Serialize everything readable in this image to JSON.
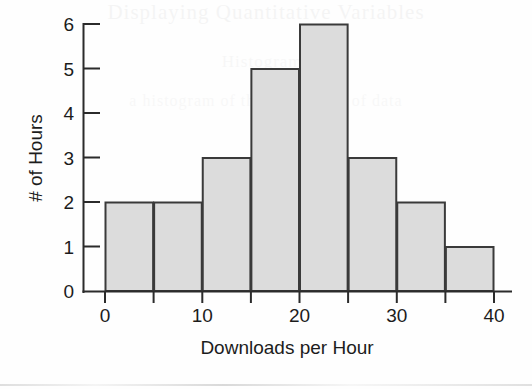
{
  "figure": {
    "background_color": "#fefefe",
    "bar_fill_color": "#dcdcdc",
    "bar_stroke_color": "#3a3a3a",
    "axis_color": "#2b2b2b",
    "ghost_text_top": "Displaying Quantitative Variables",
    "ghost_text_mid": "Histograms",
    "ghost_text_low": "a histogram of the downloads of data"
  },
  "chart_data": {
    "type": "bar",
    "subtype": "histogram",
    "title": "",
    "xlabel": "Downloads per Hour",
    "ylabel": "# of Hours",
    "bin_width": 5,
    "bin_edges": [
      0,
      5,
      10,
      15,
      20,
      25,
      30,
      35,
      40
    ],
    "categories": [
      "0-5",
      "5-10",
      "10-15",
      "15-20",
      "20-25",
      "25-30",
      "30-35",
      "35-40"
    ],
    "values": [
      2,
      2,
      3,
      5,
      6,
      3,
      2,
      1
    ],
    "xlim": [
      0,
      40
    ],
    "ylim": [
      0,
      6
    ],
    "x_ticks": [
      0,
      5,
      10,
      15,
      20,
      25,
      30,
      35,
      40
    ],
    "x_tick_labels": [
      "0",
      "",
      "10",
      "",
      "20",
      "",
      "30",
      "",
      "40"
    ],
    "x_major_ticks": [
      0,
      10,
      20,
      30,
      40
    ],
    "x_major_tick_labels": [
      "0",
      "10",
      "20",
      "30",
      "40"
    ],
    "y_ticks": [
      0,
      1,
      2,
      3,
      4,
      5,
      6
    ],
    "y_tick_labels": [
      "0",
      "1",
      "2",
      "3",
      "4",
      "5",
      "6"
    ],
    "grid": false,
    "legend": false,
    "legend_position": "none"
  }
}
